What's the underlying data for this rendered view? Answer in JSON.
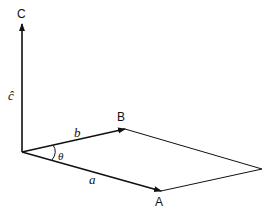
{
  "diagram": {
    "type": "vector-parallelogram",
    "points": {
      "origin": "O",
      "A": "A",
      "B": "B",
      "C": "C"
    },
    "labels": {
      "point_a": "A",
      "point_b": "B",
      "point_c": "C",
      "vector_a": "a",
      "vector_b": "b",
      "vector_c": "ĉ",
      "angle": "θ"
    },
    "edges": [
      {
        "from": "O",
        "to": "A",
        "label": "a",
        "arrow": true
      },
      {
        "from": "O",
        "to": "B",
        "label": "b",
        "arrow": true
      },
      {
        "from": "O",
        "to": "C",
        "label": "ĉ",
        "arrow": true
      },
      {
        "from": "B",
        "to": "D",
        "label": "",
        "arrow": false
      },
      {
        "from": "A",
        "to": "D",
        "label": "",
        "arrow": false
      }
    ],
    "colors": {
      "stroke": "#111111",
      "background": "#ffffff"
    }
  }
}
